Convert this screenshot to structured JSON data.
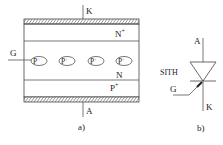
{
  "panel_a": {
    "caption": "a)",
    "terminals": {
      "cathode": "K",
      "anode": "A",
      "gate": "G"
    },
    "layers": {
      "top": "N",
      "top_sup": "+",
      "middle": "N",
      "bottom": "P",
      "bottom_sup": "+"
    },
    "gate_regions": [
      {
        "label": "P",
        "sup": "+"
      },
      {
        "label": "P",
        "sup": "+"
      },
      {
        "label": "P",
        "sup": "+"
      },
      {
        "label": "P",
        "sup": "+"
      }
    ]
  },
  "panel_b": {
    "caption": "b)",
    "device_name": "SITH",
    "terminals": {
      "anode": "A",
      "gate": "G",
      "cathode": "K"
    }
  },
  "colors": {
    "line": "#444444",
    "text": "#222222",
    "hatch": "#555555"
  }
}
